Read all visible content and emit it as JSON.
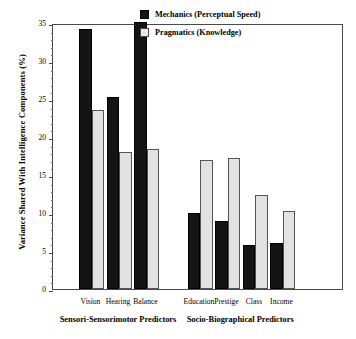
{
  "chart_data": {
    "type": "bar",
    "title": "",
    "xlabel": "",
    "ylabel": "Variance Shared With Intelligence Components (%)",
    "ylim": [
      0,
      35
    ],
    "yticks": [
      0,
      5,
      10,
      15,
      20,
      25,
      30,
      35
    ],
    "ytick_labels": [
      "0",
      "5",
      "10",
      "15",
      "20",
      "25",
      "30",
      "35"
    ],
    "minor_tick_step": 1,
    "grid": false,
    "legend_position": "top-right",
    "categories": [
      "Vision",
      "Hearing",
      "Balance",
      "Education",
      "Prestige",
      "Class",
      "Income"
    ],
    "groups": [
      {
        "label": "Sensori-Sensorimotor Predictors",
        "categories": [
          "Vision",
          "Hearing",
          "Balance"
        ]
      },
      {
        "label": "Socio-Biographical Predictors",
        "categories": [
          "Education",
          "Prestige",
          "Class",
          "Income"
        ]
      }
    ],
    "series": [
      {
        "name": "Mechanics (Perceptual Speed)",
        "color": "#141414",
        "values": [
          34.2,
          25.3,
          35.1,
          10.0,
          8.9,
          5.8,
          6.0
        ]
      },
      {
        "name": "Pragmatics (Knowledge)",
        "color": "#e2e2e2",
        "values": [
          23.5,
          18.0,
          18.4,
          17.0,
          17.2,
          12.4,
          10.2
        ]
      }
    ]
  },
  "legend": {
    "items": [
      {
        "label": "Mechanics (Perceptual Speed)",
        "swatch": "mech"
      },
      {
        "label": "Pragmatics (Knowledge)",
        "swatch": "prag"
      }
    ]
  },
  "axis": {
    "y_title": "Variance Shared With Intelligence Components (%)"
  },
  "colors": {
    "mechanics": "#141414",
    "pragmatics": "#e2e2e2",
    "frame": "#4a4a4a",
    "background": "#ffffff"
  }
}
